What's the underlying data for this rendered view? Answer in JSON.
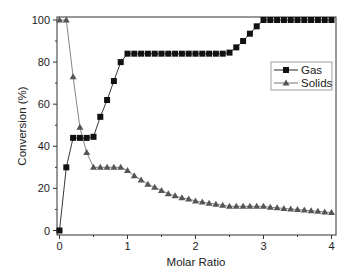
{
  "chart_data": {
    "type": "line",
    "title": "",
    "xlabel": "Molar Ratio",
    "ylabel": "Conversion (%)",
    "xlim": [
      0,
      4
    ],
    "ylim": [
      0,
      100
    ],
    "xticks": [
      0,
      1,
      2,
      3,
      4
    ],
    "yticks": [
      0,
      20,
      40,
      60,
      80,
      100
    ],
    "grid": false,
    "legend_position": "right-upper-middle",
    "x": [
      0,
      0.1,
      0.2,
      0.3,
      0.4,
      0.5,
      0.6,
      0.7,
      0.8,
      0.9,
      1.0,
      1.1,
      1.2,
      1.3,
      1.4,
      1.5,
      1.6,
      1.7,
      1.8,
      1.9,
      2.0,
      2.1,
      2.2,
      2.3,
      2.4,
      2.5,
      2.6,
      2.7,
      2.8,
      2.9,
      3.0,
      3.1,
      3.2,
      3.3,
      3.4,
      3.5,
      3.6,
      3.7,
      3.8,
      3.9,
      4.0
    ],
    "series": [
      {
        "name": "Gas",
        "marker": "square",
        "color": "#111111",
        "values": [
          0,
          30,
          44,
          44,
          44,
          44.5,
          54,
          62,
          71,
          80,
          84,
          84,
          84,
          84,
          84,
          84,
          84,
          84,
          84,
          84,
          84,
          84,
          84,
          84,
          84,
          84.5,
          87,
          90,
          93.5,
          97,
          100,
          100,
          100,
          100,
          100,
          100,
          100,
          100,
          100,
          100,
          100
        ]
      },
      {
        "name": "Solids",
        "marker": "triangle",
        "color": "#555555",
        "values": [
          100,
          100,
          73,
          49,
          37,
          30,
          30,
          30,
          30,
          30,
          28.5,
          26,
          24,
          22,
          20.5,
          19,
          17.5,
          16.5,
          15.5,
          15,
          14,
          13.5,
          13,
          12.5,
          12,
          11.5,
          11.5,
          11.5,
          11.5,
          11.5,
          11.5,
          11,
          10.8,
          10.5,
          10.2,
          10,
          9.7,
          9.4,
          9.1,
          8.8,
          8.5
        ]
      }
    ]
  }
}
